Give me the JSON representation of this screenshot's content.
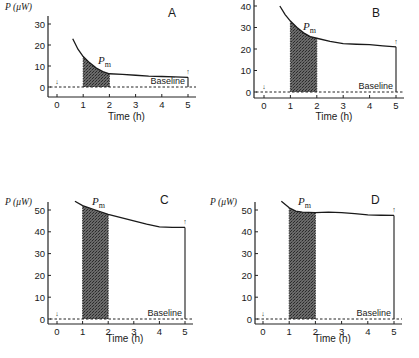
{
  "figure": {
    "shared": {
      "ylabel": "P (μW)",
      "xlabel": "Time (h)",
      "baseline_label": "Baseline",
      "pm_label": "P",
      "pm_sub": "m",
      "x_ticks": [
        "0",
        "1",
        "2",
        "3",
        "4",
        "5"
      ]
    },
    "panels": [
      {
        "id": "A",
        "y_ticks": [
          "0",
          "10",
          "20",
          "30"
        ]
      },
      {
        "id": "B",
        "y_ticks": [
          "0",
          "10",
          "20",
          "30",
          "40"
        ]
      },
      {
        "id": "C",
        "y_ticks": [
          "0",
          "10",
          "20",
          "30",
          "40",
          "50"
        ]
      },
      {
        "id": "D",
        "y_ticks": [
          "0",
          "10",
          "20",
          "30",
          "40",
          "50"
        ]
      }
    ]
  },
  "chart_data": [
    {
      "type": "line",
      "title": "A",
      "xlabel": "Time (h)",
      "ylabel": "P (μW)",
      "xlim": [
        0,
        5
      ],
      "ylim": [
        0,
        30
      ],
      "series": [
        {
          "name": "Heat output P",
          "x": [
            0.6,
            0.8,
            1.0,
            1.25,
            1.5,
            1.75,
            2.0,
            2.5,
            3.0,
            3.5,
            4.0,
            4.5,
            5.0
          ],
          "y": [
            23,
            18,
            14.5,
            11.5,
            9,
            7.3,
            6.3,
            6.0,
            5.6,
            5.2,
            5.0,
            4.8,
            4.6
          ]
        },
        {
          "name": "Baseline",
          "x": [
            0,
            5
          ],
          "y": [
            0,
            0
          ]
        }
      ],
      "shaded_region": {
        "label": "Pm",
        "x_start": 1,
        "x_end": 2
      },
      "annotations": [
        "Pm",
        "Baseline",
        "↓ at t=0",
        "↑ at t=5"
      ],
      "grid": false
    },
    {
      "type": "line",
      "title": "B",
      "xlabel": "Time (h)",
      "ylabel": "P (μW)",
      "xlim": [
        0,
        5
      ],
      "ylim": [
        0,
        40
      ],
      "series": [
        {
          "name": "Heat output P",
          "x": [
            0.6,
            0.8,
            1.0,
            1.25,
            1.5,
            1.75,
            2.0,
            2.5,
            3.0,
            3.5,
            4.0,
            4.5,
            5.0
          ],
          "y": [
            40,
            36,
            33,
            30,
            27.5,
            25.8,
            25,
            23.5,
            22.5,
            22.2,
            22,
            21.5,
            21
          ]
        },
        {
          "name": "Baseline",
          "x": [
            0,
            5
          ],
          "y": [
            0,
            0
          ]
        }
      ],
      "shaded_region": {
        "label": "Pm",
        "x_start": 1,
        "x_end": 2
      },
      "annotations": [
        "Pm",
        "Baseline",
        "↓ at t=0",
        "↑ at t=5"
      ],
      "grid": false
    },
    {
      "type": "line",
      "title": "C",
      "xlabel": "Time (h)",
      "ylabel": "P (μW)",
      "xlim": [
        0,
        5
      ],
      "ylim": [
        0,
        50
      ],
      "series": [
        {
          "name": "Heat output P",
          "x": [
            0.7,
            1.0,
            1.5,
            2.0,
            2.5,
            3.0,
            3.5,
            4.0,
            4.5,
            5.0
          ],
          "y": [
            54,
            52,
            50,
            48,
            46.5,
            45,
            43.5,
            42.3,
            42,
            42
          ]
        },
        {
          "name": "Baseline",
          "x": [
            0,
            5
          ],
          "y": [
            0,
            0
          ]
        }
      ],
      "shaded_region": {
        "label": "Pm",
        "x_start": 1,
        "x_end": 2
      },
      "annotations": [
        "Pm",
        "Baseline",
        "↓ at t=0",
        "↑ at t=5"
      ],
      "grid": false
    },
    {
      "type": "line",
      "title": "D",
      "xlabel": "Time (h)",
      "ylabel": "P (μW)",
      "xlim": [
        0,
        5
      ],
      "ylim": [
        0,
        50
      ],
      "series": [
        {
          "name": "Heat output P",
          "x": [
            0.7,
            1.0,
            1.25,
            1.5,
            2.0,
            2.5,
            3.0,
            3.5,
            4.0,
            4.5,
            5.0
          ],
          "y": [
            54,
            51,
            49.5,
            49,
            48.8,
            49,
            48.8,
            48.3,
            47.8,
            47.6,
            47.5
          ]
        },
        {
          "name": "Baseline",
          "x": [
            0,
            5
          ],
          "y": [
            0,
            0
          ]
        }
      ],
      "shaded_region": {
        "label": "Pm",
        "x_start": 1,
        "x_end": 2
      },
      "annotations": [
        "Pm",
        "Baseline",
        "↓ at t=0",
        "↑ at t=5"
      ],
      "grid": false
    }
  ]
}
